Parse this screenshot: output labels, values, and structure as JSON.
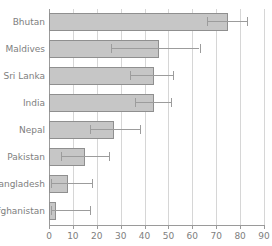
{
  "chart_data": {
    "type": "bar",
    "orientation": "horizontal",
    "title": "",
    "xlabel": "",
    "ylabel": "",
    "xlim": [
      0,
      90
    ],
    "xticks": [
      0,
      10,
      20,
      30,
      40,
      50,
      60,
      70,
      80,
      90
    ],
    "xtick_labels": [
      "0",
      "10",
      "20",
      "30",
      "40",
      "50",
      "60",
      "70",
      "80",
      "90"
    ],
    "grid": "vertical",
    "legend": "none",
    "categories": [
      "Bhutan",
      "Maldives",
      "Sri Lanka",
      "India",
      "Nepal",
      "Pakistan",
      "Bangladesh",
      "Afghanistan"
    ],
    "values": [
      75,
      46,
      44,
      44,
      27,
      15,
      8,
      3
    ],
    "error_low": [
      66,
      26,
      34,
      36,
      17,
      5,
      1,
      1
    ],
    "error_high": [
      83,
      63,
      52,
      51,
      38,
      25,
      18,
      17
    ],
    "bar_fill": "#c6c6c6",
    "bar_edge": "#8f8f8f",
    "error_color": "#9c9c9c",
    "grid_color": "#d6d6d6",
    "axis_color": "#9a9a9a"
  },
  "axis": {
    "x_tick_labels": [
      "0",
      "10",
      "20",
      "30",
      "40",
      "50",
      "60",
      "70",
      "80",
      "90"
    ],
    "y_tick_labels": [
      "Bhutan",
      "Maldives",
      "Sri Lanka",
      "India",
      "Nepal",
      "Pakistan",
      "Bangladesh",
      "Afghanistan"
    ]
  },
  "title_sliver": {
    "text": ""
  }
}
